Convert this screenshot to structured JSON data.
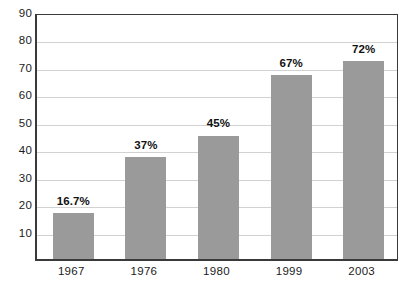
{
  "chart_data": {
    "type": "bar",
    "title": "",
    "subtitle": "",
    "xlabel": "",
    "ylabel": "",
    "categories": [
      "1967",
      "1976",
      "1980",
      "1999",
      "2003"
    ],
    "values": [
      16.7,
      37,
      45,
      67,
      72
    ],
    "data_labels": [
      "16.7%",
      "37%",
      "45%",
      "67%",
      "72%"
    ],
    "series": [
      {
        "name": "",
        "values": [
          16.7,
          37,
          45,
          67,
          72
        ]
      }
    ],
    "ylim": [
      0,
      90
    ],
    "y_ticks": [
      90,
      80,
      70,
      60,
      50,
      40,
      30,
      20,
      10
    ],
    "y_tick_labels": [
      "90",
      "80",
      "70",
      "60",
      "50",
      "40",
      "30",
      "20",
      "10"
    ],
    "grid": true,
    "grid_axis": "y",
    "legend": false,
    "legend_position": "none",
    "bar_color": "#9a9a9a",
    "gridline_color": "#d2d2d2",
    "axis_color": "#3a3a3a",
    "label_color": "#111111",
    "background_color": "#ffffff"
  }
}
